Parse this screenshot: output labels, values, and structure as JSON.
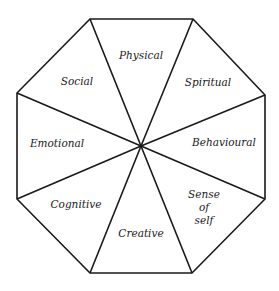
{
  "diagram": {
    "shape": "octagon",
    "stroke_color": "#1a1a1a",
    "background": "#ffffff",
    "center": [
      141,
      146
    ],
    "vertices": [
      [
        90,
        19
      ],
      [
        193,
        19
      ],
      [
        265,
        95
      ],
      [
        265,
        199
      ],
      [
        192,
        273
      ],
      [
        90,
        273
      ],
      [
        17,
        199
      ],
      [
        17,
        93
      ]
    ],
    "segments": [
      {
        "label": "Physical",
        "x": 141,
        "y": 55
      },
      {
        "label": "Spiritual",
        "x": 208,
        "y": 82
      },
      {
        "label": "Behavioural",
        "x": 224,
        "y": 142
      },
      {
        "label": "Sense\nof\nself",
        "x": 204,
        "y": 207
      },
      {
        "label": "Creative",
        "x": 141,
        "y": 233
      },
      {
        "label": "Cognitive",
        "x": 76,
        "y": 204
      },
      {
        "label": "Emotional",
        "x": 57,
        "y": 143
      },
      {
        "label": "Social",
        "x": 77,
        "y": 81
      }
    ]
  }
}
